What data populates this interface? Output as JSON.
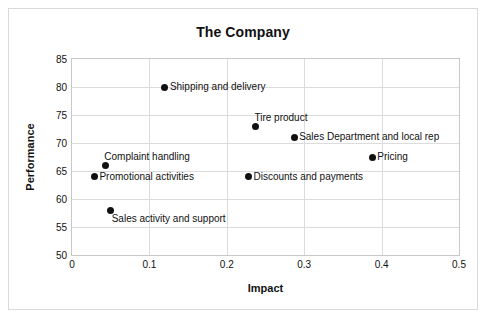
{
  "chart_data": {
    "type": "scatter",
    "title": "The Company",
    "xlabel": "Impact",
    "ylabel": "Performance",
    "xlim": [
      0,
      0.5
    ],
    "ylim": [
      50,
      85
    ],
    "xticks": [
      "0",
      "0.1",
      "0.2",
      "0.3",
      "0.4",
      "0.5"
    ],
    "xtick_values": [
      0,
      0.1,
      0.2,
      0.3,
      0.4,
      0.5
    ],
    "yticks": [
      "50",
      "55",
      "60",
      "65",
      "70",
      "75",
      "80",
      "85"
    ],
    "ytick_values": [
      50,
      55,
      60,
      65,
      70,
      75,
      80,
      85
    ],
    "grid": true,
    "legend": "none",
    "marker_color": "#111111",
    "points": [
      {
        "label": "Shipping and delivery",
        "x": 0.12,
        "y": 80,
        "label_pos": "right"
      },
      {
        "label": "Tire product",
        "x": 0.237,
        "y": 73,
        "label_pos": "above-right"
      },
      {
        "label": "Sales Department and local rep",
        "x": 0.287,
        "y": 71,
        "label_pos": "right"
      },
      {
        "label": "Pricing",
        "x": 0.388,
        "y": 67.5,
        "label_pos": "right"
      },
      {
        "label": "Complaint handling",
        "x": 0.043,
        "y": 66,
        "label_pos": "above-right"
      },
      {
        "label": "Promotional activities",
        "x": 0.029,
        "y": 64,
        "label_pos": "right"
      },
      {
        "label": "Discounts and payments",
        "x": 0.228,
        "y": 64,
        "label_pos": "right"
      },
      {
        "label": "Sales activity and support",
        "x": 0.05,
        "y": 58,
        "label_pos": "below-right"
      }
    ]
  }
}
